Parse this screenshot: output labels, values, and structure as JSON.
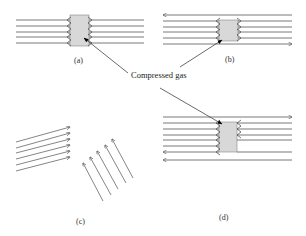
{
  "figure": {
    "panels": [
      {
        "id": "a",
        "label": "(a)"
      },
      {
        "id": "b",
        "label": "(b)"
      },
      {
        "id": "c",
        "label": "(c)"
      },
      {
        "id": "d",
        "label": "(d)"
      }
    ],
    "callout": {
      "text": "Compressed gas"
    },
    "colors": {
      "line": "#555555",
      "box_fill": "#d8d8d8",
      "box_stroke": "#777777",
      "marker": "#000000"
    }
  }
}
